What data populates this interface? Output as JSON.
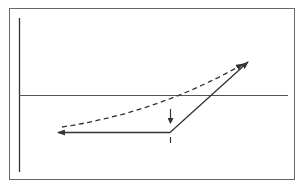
{
  "diagram": {
    "colors": {
      "line": "#333333",
      "frame": "#555555",
      "background": "#ffffff"
    },
    "elements": {
      "frame": "rectangle border",
      "vertical_axis": "left vertical axis line",
      "horizontal_line": "horizontal reference line",
      "solid_path": "solid line with left-pointing arrowhead, kink, rising diagonal to upper right with arrowhead",
      "dashed_path": "dashed curve rising to upper right with arrowhead",
      "down_arrow": "small vertical arrow pointing down toward kink",
      "tick_mark": "small vertical tick below kink"
    }
  }
}
